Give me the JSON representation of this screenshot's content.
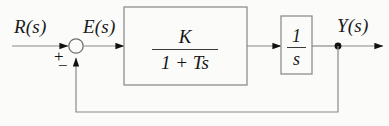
{
  "diagram": {
    "background_color": "#fbfbfa",
    "line_color": "#8a8a8a",
    "arrow_color": "#111111",
    "text_color": "#161616",
    "signals": {
      "input_label": "R(s)",
      "error_label": "E(s)",
      "output_label": "Y(s)"
    },
    "summing_junction": {
      "name": "summing-junction",
      "plus_sign": "+",
      "minus_sign": "−",
      "center_x": 76,
      "center_y": 46,
      "radius": 7
    },
    "blocks": [
      {
        "name": "gain-block",
        "transfer_function": "K / (1 + Ts)",
        "numerator": "K",
        "denominator": "1 + Ts",
        "x": 124,
        "y": 7,
        "width": 123,
        "height": 78
      },
      {
        "name": "integrator-block",
        "transfer_function": "1 / s",
        "numerator": "1",
        "denominator": "s",
        "x": 281,
        "y": 16,
        "width": 31,
        "height": 58
      }
    ],
    "feedback": {
      "name": "feedback-path",
      "tap_x": 338,
      "tap_y": 46,
      "bottom_y": 112,
      "return_x": 76,
      "sign": "negative"
    }
  }
}
